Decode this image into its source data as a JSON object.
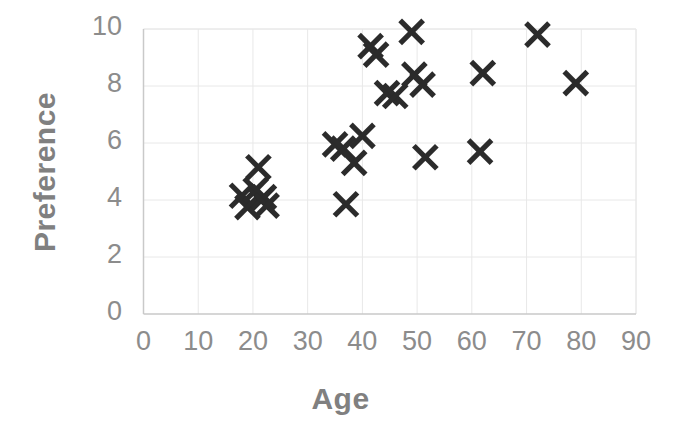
{
  "chart_data": {
    "type": "scatter",
    "title": "",
    "xlabel": "Age",
    "ylabel": "Preference",
    "xlim": [
      0,
      90
    ],
    "ylim": [
      0,
      10
    ],
    "xticks": [
      0,
      10,
      20,
      30,
      40,
      50,
      60,
      70,
      80,
      90
    ],
    "yticks": [
      0,
      2,
      4,
      6,
      8,
      10
    ],
    "grid": true,
    "legend": null,
    "marker": "x",
    "marker_color": "#2b2b2b",
    "axis_color": "#8c8c8c",
    "label_color": "#808080",
    "gridline_color": "#e8e8e8",
    "points": [
      {
        "x": 18,
        "y": 4.15
      },
      {
        "x": 19,
        "y": 3.75
      },
      {
        "x": 20.5,
        "y": 4.35
      },
      {
        "x": 21,
        "y": 5.15
      },
      {
        "x": 21.5,
        "y": 4.0
      },
      {
        "x": 22,
        "y": 4.1
      },
      {
        "x": 22.5,
        "y": 3.8
      },
      {
        "x": 35,
        "y": 5.95
      },
      {
        "x": 36.5,
        "y": 5.8
      },
      {
        "x": 37,
        "y": 3.85
      },
      {
        "x": 38.5,
        "y": 5.3
      },
      {
        "x": 40,
        "y": 6.25
      },
      {
        "x": 41.5,
        "y": 9.4
      },
      {
        "x": 42.5,
        "y": 9.1
      },
      {
        "x": 44.5,
        "y": 7.75
      },
      {
        "x": 46,
        "y": 7.65
      },
      {
        "x": 49,
        "y": 9.9
      },
      {
        "x": 49.5,
        "y": 8.4
      },
      {
        "x": 51,
        "y": 8.05
      },
      {
        "x": 51.5,
        "y": 5.5
      },
      {
        "x": 61.5,
        "y": 5.7
      },
      {
        "x": 62,
        "y": 8.45
      },
      {
        "x": 72,
        "y": 9.8
      },
      {
        "x": 79,
        "y": 8.1
      }
    ]
  },
  "axis": {
    "x_title": "Age",
    "y_title": "Preference",
    "x_tick_labels": [
      "0",
      "10",
      "20",
      "30",
      "40",
      "50",
      "60",
      "70",
      "80",
      "90"
    ],
    "y_tick_labels": [
      "0",
      "2",
      "4",
      "6",
      "8",
      "10"
    ]
  }
}
